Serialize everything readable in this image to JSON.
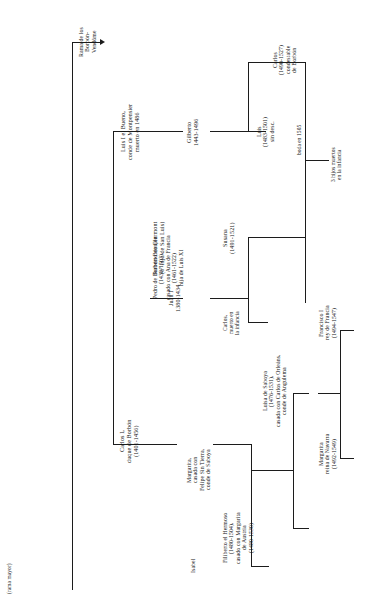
{
  "document": {
    "type": "genealogy-chart",
    "language": "es",
    "orientation": "text-rotated-90-ccw",
    "header_note": "(rama mayor)"
  },
  "nodes": {
    "rama_vendome": "Rama de los\nBorbón-\nVendôme",
    "luis_i": "Luis I el Bueno,\nconde de Montpensier\nmuerto en 1486",
    "gilberto": "Gilberto\n1443-1496",
    "carlos_condestable": "Carlos\n(1490-1527)\ncondestable\nde Borbón",
    "luis_1483": "Luis\n(1483-1501)\nsin desc.",
    "boda_1505": "boda en 1505",
    "tres_hijos": "3 hijos muertos\nen la infancia",
    "roberto_clermont": "Roberto de Clermont\n(6º hijo de San Luis)",
    "juan_i": "Juan I\n1380-1434",
    "pedro_beaujeu": "Pedro de Borbón-Beaujeu\n(1438-1503),\ncasado con Ana de Francia\n(1461-1522)\nhija de Luis XI",
    "susana": "Susana\n(1491-1521)",
    "carlos_muerto": "Carlos,\nmuerto en\nla infancia",
    "carlos_i": "Carlos I,\nduque de Borbón\n(1401-1456)",
    "isabel": "Isabel",
    "margarita_saboya": "Margarita,\ncasada con\nFelipe Sin Tierra,\nconde de Saboya",
    "filiberto": "Filiberto el Hermoso\n(1480-1504),\ncasado con Margarita\nde Austria\n(1480-1530)",
    "luisa_saboya": "Luisa de Saboya\n(1476-1531),\ncasada con Carlos de Orleáns,\nconde de Angulema",
    "francisco_i": "Francisco I\nrey de Francia\n(1494-1547)",
    "margarita_navarra": "Margarita\nreina de Navarra\n(1492-1549)"
  },
  "colors": {
    "text": "#141414",
    "line": "#1c1c1c",
    "background": "#ffffff"
  }
}
